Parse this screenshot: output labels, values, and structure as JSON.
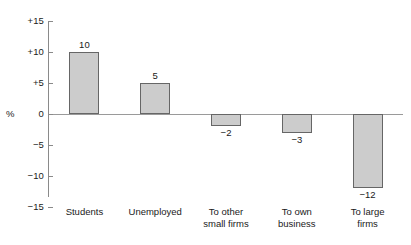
{
  "chart_data": {
    "type": "bar",
    "title": "",
    "xlabel": "",
    "ylabel": "%",
    "categories": [
      "Students",
      "To other small firms",
      "Unemployed",
      "To own business",
      "To large firms"
    ],
    "bars": [
      {
        "label_line1": "Students",
        "label_line2": "",
        "value": 10,
        "value_text": "10"
      },
      {
        "label_line1": "Unemployed",
        "label_line2": "",
        "value": 5,
        "value_text": "5"
      },
      {
        "label_line1": "To other",
        "label_line2": "small firms",
        "value": -2,
        "value_text": "−2"
      },
      {
        "label_line1": "To own",
        "label_line2": "business",
        "value": -3,
        "value_text": "−3"
      },
      {
        "label_line1": "To large",
        "label_line2": "firms",
        "value": -12,
        "value_text": "−12"
      }
    ],
    "values": [
      10,
      5,
      -2,
      -3,
      -12
    ],
    "ylim": [
      -15,
      15
    ],
    "yticks": [
      15,
      10,
      5,
      0,
      -5,
      -10,
      -15
    ],
    "ytick_labels": [
      "+15",
      "+10",
      "+5",
      "0",
      "−5",
      "−10",
      "−15"
    ],
    "grid": false,
    "legend": null,
    "bar_fill_color": "#cccccc",
    "bar_border_color": "#666666",
    "axis_color": "#8a8a8a",
    "text_color": "#1a1a1a"
  }
}
